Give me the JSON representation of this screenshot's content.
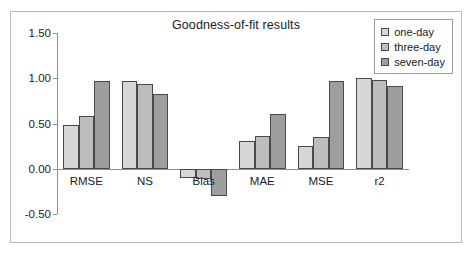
{
  "chart_data": {
    "type": "bar",
    "title": "Goodness-of-fit results",
    "xlabel": "",
    "ylabel": "",
    "categories": [
      "RMSE",
      "NS",
      "Bias",
      "MAE",
      "MSE",
      "r2"
    ],
    "series": [
      {
        "name": "one-day",
        "color": "#d6d6d6",
        "values": [
          0.48,
          0.97,
          -0.1,
          0.31,
          0.25,
          1.0
        ]
      },
      {
        "name": "three-day",
        "color": "#bdbdbd",
        "values": [
          0.58,
          0.94,
          -0.11,
          0.36,
          0.35,
          0.98
        ]
      },
      {
        "name": "seven-day",
        "color": "#9e9e9e",
        "values": [
          0.97,
          0.83,
          -0.3,
          0.61,
          0.97,
          0.91
        ]
      }
    ],
    "ylim": [
      -0.5,
      1.5
    ],
    "yticks": [
      1.5,
      1.0,
      0.5,
      0.0,
      -0.5
    ],
    "ytick_labels": [
      "1.50",
      "1.00",
      "0.50",
      "0.00",
      "-0.50"
    ],
    "grid": false,
    "legend_position": "top-right"
  },
  "legend": {
    "items": [
      {
        "label": "one-day"
      },
      {
        "label": "three-day"
      },
      {
        "label": "seven-day"
      }
    ]
  }
}
